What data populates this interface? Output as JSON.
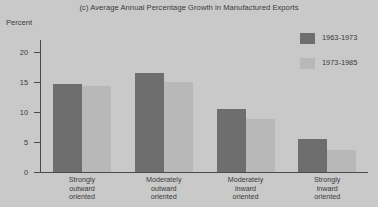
{
  "chart_data": {
    "type": "bar",
    "title": "(c) Average Annual Percentage Growth in Manufactured Exports",
    "xlabel": "",
    "ylabel": "Percent",
    "ylim": [
      0,
      22
    ],
    "yticks": [
      0,
      5,
      10,
      15,
      20
    ],
    "ytick_labels": [
      "0",
      "5",
      "10",
      "15",
      "20"
    ],
    "grid": false,
    "legend_position": "top-right",
    "categories": [
      "Strongly\noutward\noriented",
      "Moderately\noutward\noriented",
      "Moderately\ninward\noriented",
      "Strongly\ninward\noriented"
    ],
    "series": [
      {
        "name": "1963-1973",
        "color": "#6e6e6e",
        "values": [
          14.7,
          16.5,
          10.5,
          5.5
        ]
      },
      {
        "name": "1973-1985",
        "color": "#b8b8b8",
        "values": [
          14.3,
          15.0,
          8.8,
          3.7
        ]
      }
    ]
  },
  "colors": {
    "background": "#c9c9c9",
    "axis": "#4a4a4a",
    "text": "#3a3a3a",
    "series_1963_1973": "#6e6e6e",
    "series_1973_1985": "#b8b8b8"
  }
}
